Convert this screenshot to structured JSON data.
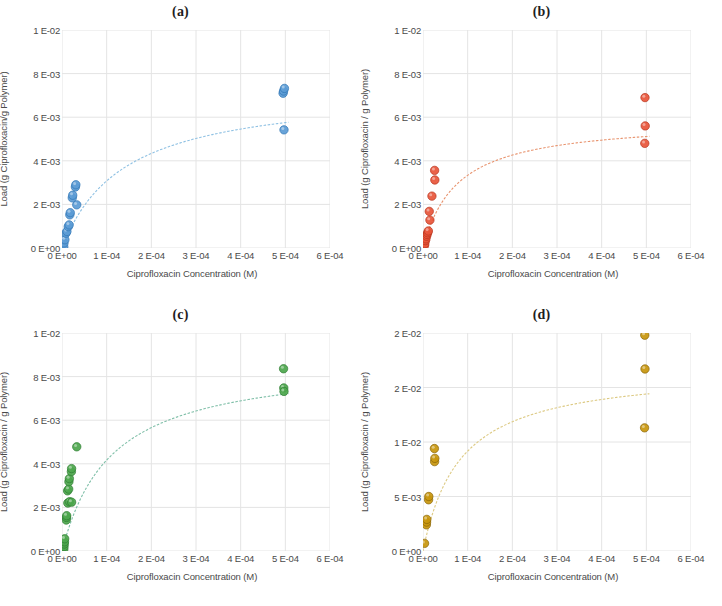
{
  "figure": {
    "panel_count": 4,
    "background": "#ffffff"
  },
  "axis_common": {
    "xlabel": "Ciprofloxacin Concentration (M)",
    "xticks": [
      "0 E+00",
      "1 E-04",
      "2 E-04",
      "3 E-04",
      "4 E-04",
      "5 E-04",
      "6 E-04"
    ],
    "xtick_values": [
      0,
      0.0001,
      0.0002,
      0.0003,
      0.0004,
      0.0005,
      0.0006
    ],
    "xlim": [
      0,
      0.0006
    ],
    "grid": true,
    "grid_color": "#e4e4e4"
  },
  "chart_data": [
    {
      "type": "scatter",
      "title": "(a)",
      "xlabel": "Ciprofloxacin Concentration (M)",
      "ylabel": "Load (g Ciprofloxacin/g Polymer)",
      "xlim": [
        0,
        0.0006
      ],
      "ylim": [
        0,
        0.01
      ],
      "xticks": [
        "0 E+00",
        "1 E-04",
        "2 E-04",
        "3 E-04",
        "4 E-04",
        "5 E-04",
        "6 E-04"
      ],
      "yticks": [
        "0 E+00",
        "2 E-03",
        "4 E-03",
        "6 E-03",
        "8 E-03",
        "1 E-02"
      ],
      "ytick_values": [
        0,
        0.002,
        0.004,
        0.006,
        0.008,
        0.01
      ],
      "marker_color": "#5b9bd5",
      "marker_edge": "#2f75b5",
      "fit_color": "#8fc1e3",
      "grid": true,
      "legend": "none",
      "points": [
        {
          "x": 4e-06,
          "y": 5e-05
        },
        {
          "x": 4.5e-06,
          "y": 0.00023
        },
        {
          "x": 6.5e-06,
          "y": 0.00038
        },
        {
          "x": 9e-06,
          "y": 0.00068
        },
        {
          "x": 1.1e-05,
          "y": 0.00076
        },
        {
          "x": 1.4e-05,
          "y": 0.00098
        },
        {
          "x": 1.6e-05,
          "y": 0.00106
        },
        {
          "x": 1.75e-05,
          "y": 0.00152
        },
        {
          "x": 1.85e-05,
          "y": 0.00162
        },
        {
          "x": 2.3e-05,
          "y": 0.0023
        },
        {
          "x": 2.4e-05,
          "y": 0.00242
        },
        {
          "x": 3.3e-05,
          "y": 0.00198
        },
        {
          "x": 3e-05,
          "y": 0.0028
        },
        {
          "x": 3.1e-05,
          "y": 0.0029
        },
        {
          "x": 0.000495,
          "y": 0.0071
        },
        {
          "x": 0.000496,
          "y": 0.0072
        },
        {
          "x": 0.000498,
          "y": 0.00732
        },
        {
          "x": 0.000497,
          "y": 0.00542
        }
      ],
      "fit_curve": {
        "kind": "langmuir",
        "qmax": 0.00735,
        "k": 7200
      }
    },
    {
      "type": "scatter",
      "title": "(b)",
      "xlabel": "Ciprofloxacin Concentration (M)",
      "ylabel": "Load (g Ciprofloxacin / g Polymer)",
      "xlim": [
        0,
        0.0006
      ],
      "ylim": [
        0,
        0.01
      ],
      "xticks": [
        "0 E+00",
        "1 E-04",
        "2 E-04",
        "3 E-04",
        "4 E-04",
        "5 E-04",
        "6 E-04"
      ],
      "yticks": [
        "0 E+00",
        "2 E-03",
        "4 E-03",
        "6 E-03",
        "8 E-03",
        "1 E-02"
      ],
      "ytick_values": [
        0,
        0.002,
        0.004,
        0.006,
        0.008,
        0.01
      ],
      "marker_color": "#e8553a",
      "marker_edge": "#b8331c",
      "fit_color": "#e8946f",
      "grid": true,
      "legend": "none",
      "points": [
        {
          "x": 3.5e-06,
          "y": 0.00012
        },
        {
          "x": 4e-06,
          "y": 0.0002
        },
        {
          "x": 5.5e-06,
          "y": 0.00034
        },
        {
          "x": 6.5e-06,
          "y": 0.00042
        },
        {
          "x": 8e-06,
          "y": 0.00054
        },
        {
          "x": 9e-06,
          "y": 0.00062
        },
        {
          "x": 1.05e-05,
          "y": 0.0007
        },
        {
          "x": 1.2e-05,
          "y": 0.00078
        },
        {
          "x": 1.55e-05,
          "y": 0.00128
        },
        {
          "x": 1.4e-05,
          "y": 0.00168
        },
        {
          "x": 2e-05,
          "y": 0.00238
        },
        {
          "x": 2.65e-05,
          "y": 0.00312
        },
        {
          "x": 2.6e-05,
          "y": 0.00356
        },
        {
          "x": 0.000497,
          "y": 0.0069
        },
        {
          "x": 0.0004975,
          "y": 0.0056
        },
        {
          "x": 0.0004965,
          "y": 0.0048
        }
      ],
      "fit_curve": {
        "kind": "langmuir",
        "qmax": 0.0059,
        "k": 13000
      }
    },
    {
      "type": "scatter",
      "title": "(c)",
      "xlabel": "Ciprofloxacin Concentration (M)",
      "ylabel": "Load (g Ciprofloxacin / g Polymer)",
      "xlim": [
        0,
        0.0006
      ],
      "ylim": [
        0,
        0.01
      ],
      "xticks": [
        "0 E+00",
        "1 E-04",
        "2 E-04",
        "3 E-04",
        "4 E-04",
        "5 E-04",
        "6 E-04"
      ],
      "yticks": [
        "0 E+00",
        "2 E-03",
        "4 E-03",
        "6 E-03",
        "8 E-03",
        "1 E-02"
      ],
      "ytick_values": [
        0,
        0.002,
        0.004,
        0.006,
        0.008,
        0.01
      ],
      "marker_color": "#4ca64c",
      "marker_edge": "#2e7d32",
      "fit_color": "#7fbfa8",
      "grid": true,
      "legend": "none",
      "points": [
        {
          "x": 4e-06,
          "y": 8e-05
        },
        {
          "x": 4.5e-06,
          "y": 0.0002
        },
        {
          "x": 5e-06,
          "y": 0.00032
        },
        {
          "x": 5.5e-06,
          "y": 0.00042
        },
        {
          "x": 6e-06,
          "y": 0.00056
        },
        {
          "x": 9.5e-06,
          "y": 0.00142
        },
        {
          "x": 1e-05,
          "y": 0.00154
        },
        {
          "x": 1.05e-05,
          "y": 0.00162
        },
        {
          "x": 1.3e-05,
          "y": 0.0022
        },
        {
          "x": 1.7e-05,
          "y": 0.00226
        },
        {
          "x": 2.15e-05,
          "y": 0.00224
        },
        {
          "x": 1.25e-05,
          "y": 0.00276
        },
        {
          "x": 1.5e-05,
          "y": 0.00284
        },
        {
          "x": 1.55e-05,
          "y": 0.00318
        },
        {
          "x": 1.65e-05,
          "y": 0.00332
        },
        {
          "x": 2.1e-05,
          "y": 0.00364
        },
        {
          "x": 2.15e-05,
          "y": 0.00378
        },
        {
          "x": 3.3e-05,
          "y": 0.00478
        },
        {
          "x": 0.000496,
          "y": 0.00836
        },
        {
          "x": 0.0004965,
          "y": 0.00748
        },
        {
          "x": 0.000497,
          "y": 0.00732
        }
      ],
      "fit_curve": {
        "kind": "langmuir",
        "qmax": 0.0088,
        "k": 9000
      }
    },
    {
      "type": "scatter",
      "title": "(d)",
      "xlabel": "Ciprofloxacin Concentration (M)",
      "ylabel": "Load (g Ciprofloxacin / g Polymer)",
      "xlim": [
        0,
        0.0006
      ],
      "ylim": [
        0,
        0.02
      ],
      "xticks": [
        "0 E+00",
        "1 E-04",
        "2 E-04",
        "3 E-04",
        "4 E-04",
        "5 E-04",
        "6 E-04"
      ],
      "yticks": [
        "0 E+00",
        "5 E-03",
        "1 E-02",
        "2 E-02",
        "2 E-02"
      ],
      "ytick_values": [
        0,
        0.005,
        0.01,
        0.015,
        0.02
      ],
      "marker_color": "#c8960c",
      "marker_edge": "#8a6508",
      "fit_color": "#ddca84",
      "grid": true,
      "legend": "none",
      "points": [
        {
          "x": 3.5e-06,
          "y": 0.0007
        },
        {
          "x": 7.5e-06,
          "y": 0.0024
        },
        {
          "x": 8e-06,
          "y": 0.00265
        },
        {
          "x": 8.5e-06,
          "y": 0.0029
        },
        {
          "x": 1.25e-05,
          "y": 0.0047
        },
        {
          "x": 1.3e-05,
          "y": 0.005
        },
        {
          "x": 2.6e-05,
          "y": 0.0082
        },
        {
          "x": 2.65e-05,
          "y": 0.0085
        },
        {
          "x": 2.55e-05,
          "y": 0.0094
        },
        {
          "x": 0.0004965,
          "y": 0.0198
        },
        {
          "x": 0.000497,
          "y": 0.0167
        },
        {
          "x": 0.000496,
          "y": 0.0113
        }
      ],
      "fit_curve": {
        "kind": "langmuir",
        "qmax": 0.0168,
        "k": 12000
      }
    }
  ]
}
